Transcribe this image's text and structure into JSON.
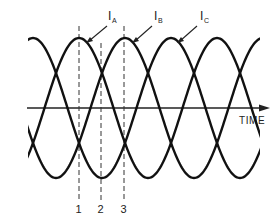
{
  "diagram": {
    "type": "three-phase current waveforms",
    "axis": {
      "label": "TIME"
    },
    "currents": [
      {
        "name": "I",
        "subscript": "A",
        "peak_x": 79
      },
      {
        "name": "I",
        "subscript": "B",
        "peak_x": 125
      },
      {
        "name": "I",
        "subscript": "C",
        "peak_x": 171
      }
    ],
    "markers": [
      {
        "label": "1",
        "x": 79
      },
      {
        "label": "2",
        "x": 101
      },
      {
        "label": "3",
        "x": 124
      }
    ],
    "colors": {
      "line": "#111111",
      "background": "#ffffff"
    }
  }
}
